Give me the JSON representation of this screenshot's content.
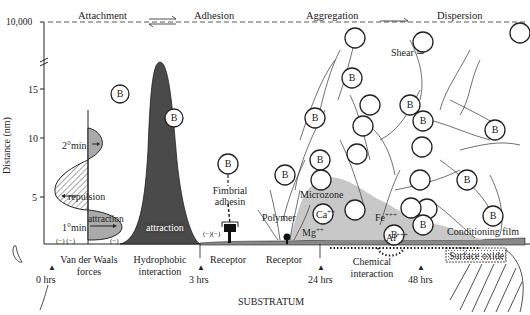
{
  "phases": {
    "attachment": "Attachment",
    "adhesion": "Adhesion",
    "aggregation": "Aggregation",
    "dispersion": "Dispersion"
  },
  "axis": {
    "label": "Distance (nm)",
    "ticks": [
      "10,000",
      "15",
      "10",
      "5"
    ]
  },
  "labels": {
    "min2": "2°min",
    "repulsion": "repulsion",
    "min1": "1°min",
    "attraction_small": "attraction",
    "attraction_large": "attraction",
    "charges_left": "(−)  (−)",
    "charge_mid": "(−)",
    "charges_receptor": "(−)(−)",
    "fimbrial": "Fimbrial",
    "adhesin": "adhesin",
    "polymer": "Polymer",
    "microzone": "Microzone",
    "ca": "Ca",
    "mg": "Mg",
    "fe": "Fe",
    "al": "Al",
    "ion_2": "++",
    "ion_3": "+++",
    "shear": "Shear ⇒",
    "conditioning_film": "Conditioning film",
    "surface_oxide": "Surface oxide",
    "bacterium": "B"
  },
  "bottom": {
    "vdw_1": "Van der Waals",
    "vdw_2": "forces",
    "hydro_1": "Hydrophobic",
    "hydro_2": "interaction",
    "receptor_1": "Receptor",
    "receptor_2": "Receptor",
    "chem_1": "Chemical",
    "chem_2": "interaction",
    "substratum": "SUBSTRATUM"
  },
  "timeline": [
    "0 hrs",
    "3 hrs",
    "24 hrs",
    "48 hrs"
  ],
  "colors": {
    "dark_fill": "#4a4a4a",
    "light_fill": "#bdbdbd",
    "microzone_fill": "#c8c8c8",
    "line": "#222222"
  }
}
